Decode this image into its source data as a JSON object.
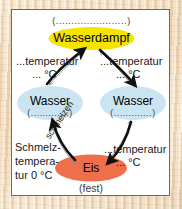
{
  "diagram": {
    "panel_background": "#ffffff",
    "border_color": "#6d6a66",
    "page_background": "#e8cfae"
  },
  "nodes": {
    "vapor": {
      "label": "Wasserdampf",
      "blank_above": "(.......................)",
      "color": "#f5e400"
    },
    "water_left": {
      "label": "Wasser",
      "blank_below": "(.............)",
      "color": "#cbe4f2"
    },
    "water_right": {
      "label": "Wasser",
      "blank_below": "(.............)",
      "color": "#cbe4f2"
    },
    "ice": {
      "label": "Eis",
      "state_below": "(fest)",
      "color": "#ef6f4a"
    }
  },
  "labels": {
    "top_left_temp_line1": "...temperatur",
    "top_left_temp_line2": "... °C",
    "top_right_temp_line1": "...temperatur",
    "top_right_temp_line2": "... °C",
    "bottom_right_temp_line1": "...temperatur",
    "bottom_right_temp_line2": "... °C",
    "melting_line1": "Schmelz-",
    "melting_line2": "tempera-",
    "melting_line3": "tur 0 °C",
    "melting_arrow": "schmelzen"
  },
  "arrows": {
    "ice_to_water_left": "schmelzen",
    "water_left_to_vapor": "",
    "vapor_to_water_right": "",
    "water_right_to_ice": ""
  },
  "colors": {
    "arrow_dark": "#111111",
    "arrow_thin": "#8c8c8c",
    "text": "#1a1a1a"
  }
}
